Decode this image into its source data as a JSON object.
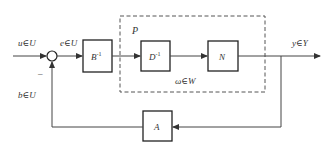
{
  "diagram": {
    "type": "feedback-block-diagram",
    "signals": {
      "input": "u∈U",
      "error": "e∈U",
      "output": "y∈Y",
      "feedback": "b∈U",
      "internal": "ω∈W",
      "minus_sign": "–"
    },
    "blocks": {
      "b_inv": {
        "base": "B",
        "sup": "-1"
      },
      "d_inv": {
        "base": "D",
        "sup": "-1"
      },
      "n": {
        "base": "N"
      },
      "a": {
        "base": "A"
      }
    },
    "group": {
      "label": "P"
    },
    "colors": {
      "line": "#444444",
      "text": "#333333",
      "background": "#ffffff"
    }
  }
}
